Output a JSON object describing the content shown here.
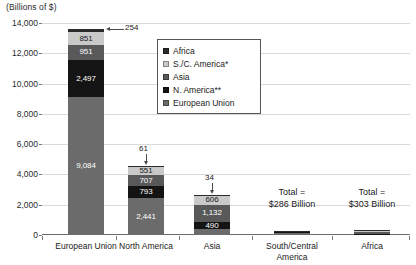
{
  "chart_data": {
    "type": "bar",
    "title": "(Billions of $)",
    "subtitle": "",
    "xlabel": "",
    "ylabel": "(Billions of $)",
    "stacked": true,
    "grid": true,
    "legend_position": "inside-top-center",
    "ylim": [
      0,
      14000
    ],
    "ytick_labels": [
      "0",
      "2,000",
      "4,000",
      "6,000",
      "8,000",
      "10,000",
      "12,000",
      "14,000"
    ],
    "ytick_values": [
      0,
      2000,
      4000,
      6000,
      8000,
      10000,
      12000,
      14000
    ],
    "categories": [
      "European Union",
      "North America",
      "Asia",
      "South/Central America",
      "Africa"
    ],
    "series": [
      {
        "name": "European Union",
        "color": "#6b6b6b",
        "values": [
          9084,
          2441,
          374,
          150,
          0
        ]
      },
      {
        "name": "N. America**",
        "color": "#141414",
        "values": [
          2497,
          793,
          490,
          60,
          95
        ]
      },
      {
        "name": "Asia",
        "color": "#595959",
        "values": [
          951,
          707,
          1132,
          40,
          120
        ]
      },
      {
        "name": "S./C. America*",
        "color": "#c9c9c9",
        "values": [
          851,
          551,
          606,
          30,
          50
        ]
      },
      {
        "name": "Africa",
        "color": "#2b2b2b",
        "values": [
          254,
          61,
          34,
          6,
          38
        ]
      }
    ],
    "bar_labels": {
      "European Union": [
        "9,084",
        "2,497",
        "951",
        "851",
        "254"
      ],
      "North America": [
        "2,441",
        "793",
        "707",
        "551",
        "61"
      ],
      "Asia": [
        "374",
        "490",
        "1,132",
        "606",
        "34"
      ]
    },
    "annotations": [
      {
        "text": "254",
        "target": "European Union top segment"
      },
      {
        "text": "61",
        "target": "North America top segment"
      },
      {
        "text": "34",
        "target": "Asia top segment"
      },
      {
        "text": "Total =\n$286 Billion",
        "target": "South/Central America"
      },
      {
        "text": "Total =\n$303 Billion",
        "target": "Africa"
      }
    ]
  },
  "legend": {
    "items": [
      {
        "label": "Africa",
        "color": "#2b2b2b"
      },
      {
        "label": "S./C. America*",
        "color": "#c9c9c9"
      },
      {
        "label": "Asia",
        "color": "#595959"
      },
      {
        "label": "N. America**",
        "color": "#141414"
      },
      {
        "label": "European Union",
        "color": "#6b6b6b"
      }
    ]
  },
  "totals": {
    "south_central_america": {
      "line1": "Total =",
      "line2": "$286 Billion"
    },
    "africa": {
      "line1": "Total =",
      "line2": "$303 Billion"
    }
  },
  "axis": {
    "y_unit_label": "(Billions of $)",
    "x_categories": [
      "European Union",
      "North America",
      "Asia",
      "South/Central\nAmerica",
      "Africa"
    ]
  }
}
